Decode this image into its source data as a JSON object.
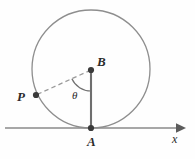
{
  "figure": {
    "background_color": "#fefefe",
    "stroke_color": "#8a8a8a",
    "dark_stroke_color": "#6e6e6e",
    "point_color": "#3a3a3a",
    "text_color": "#2b2b2b"
  },
  "labels": {
    "point_a": "A",
    "point_b": "B",
    "point_p": "P",
    "angle_theta": "θ",
    "axis_x": "x"
  },
  "chart_data": {
    "type": "scatter",
    "title": "",
    "xlabel": "x",
    "ylabel": "",
    "circle": {
      "center_x": 91,
      "center_y": 69,
      "radius": 59
    },
    "points": [
      {
        "name": "A",
        "x": 91,
        "y": 128,
        "label": "A",
        "role": "tangent-point-on-x-axis"
      },
      {
        "name": "B",
        "x": 91,
        "y": 70,
        "label": "B",
        "role": "circle-center"
      },
      {
        "name": "P",
        "x": 36,
        "y": 95,
        "label": "P",
        "role": "point-on-circle"
      }
    ],
    "segments": [
      {
        "name": "BA",
        "from": "B",
        "to": "A",
        "style": "solid"
      },
      {
        "name": "PB",
        "from": "P",
        "to": "B",
        "style": "dashed"
      }
    ],
    "angle": {
      "name": "theta",
      "label": "θ",
      "vertex": "B",
      "ray_1": "P",
      "ray_2": "A",
      "value_degrees": 115
    },
    "axis": {
      "orientation": "horizontal",
      "y": 128,
      "x_start": 5,
      "x_end": 180,
      "arrow": "right",
      "label": "x"
    },
    "grid": false,
    "legend": null
  }
}
